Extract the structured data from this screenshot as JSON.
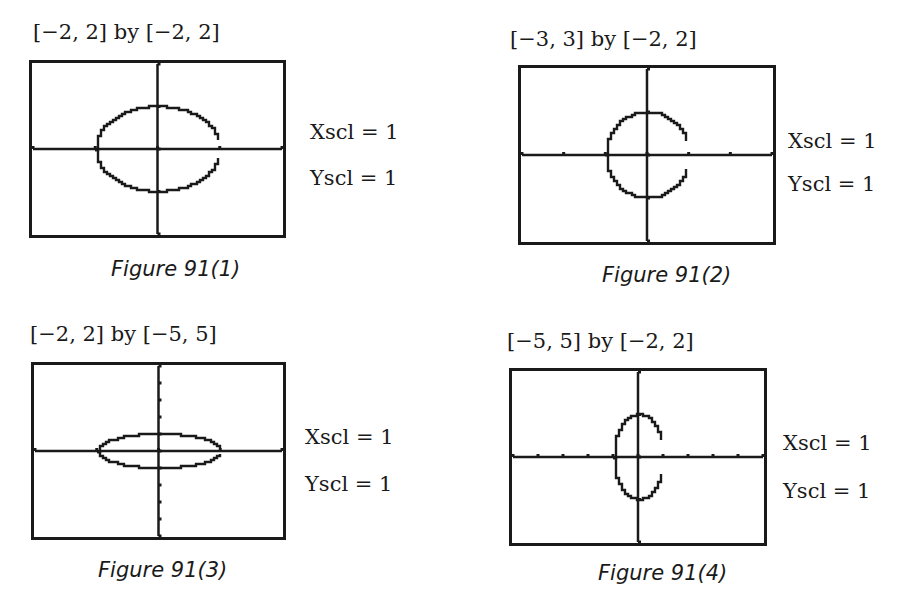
{
  "page": {
    "figures": [
      {
        "window_label": "[−2, 2] by [−2, 2]",
        "xscl_label": "Xscl = 1",
        "yscl_label": "Yscl = 1",
        "caption": "Figure 91(1)"
      },
      {
        "window_label": "[−3, 3] by [−2, 2]",
        "xscl_label": "Xscl = 1",
        "yscl_label": "Yscl = 1",
        "caption": "Figure 91(2)"
      },
      {
        "window_label": "[−2, 2] by [−5, 5]",
        "xscl_label": "Xscl = 1",
        "yscl_label": "Yscl = 1",
        "caption": "Figure 91(3)"
      },
      {
        "window_label": "[−5, 5] by [−2, 2]",
        "xscl_label": "Xscl = 1",
        "yscl_label": "Yscl = 1",
        "caption": "Figure 91(4)"
      }
    ]
  },
  "chart_data": [
    {
      "type": "line",
      "title": "Figure 91(1)",
      "window": "[-2, 2] by [-2, 2]",
      "xlim": [
        -2,
        2
      ],
      "ylim": [
        -2,
        2
      ],
      "xscl": 1,
      "yscl": 1,
      "grid": false,
      "curve": "ellipse",
      "x_intercepts": [
        -1,
        1
      ],
      "y_intercepts": [
        -1,
        1
      ],
      "semi_axis_x": 1,
      "semi_axis_y": 1,
      "note": "circle of radius 1 appears as a wide ellipse due to non-square window"
    },
    {
      "type": "line",
      "title": "Figure 91(2)",
      "window": "[-3, 3] by [-2, 2]",
      "xlim": [
        -3,
        3
      ],
      "ylim": [
        -2,
        2
      ],
      "xscl": 1,
      "yscl": 1,
      "grid": false,
      "curve": "circle",
      "x_intercepts": [
        -1,
        1
      ],
      "y_intercepts": [
        -1,
        1
      ],
      "semi_axis_x": 1,
      "semi_axis_y": 1,
      "note": "square viewing window; circle appears round"
    },
    {
      "type": "line",
      "title": "Figure 91(3)",
      "window": "[-2, 2] by [-5, 5]",
      "xlim": [
        -2,
        2
      ],
      "ylim": [
        -5,
        5
      ],
      "xscl": 1,
      "yscl": 1,
      "grid": false,
      "curve": "ellipse",
      "x_intercepts": [
        -1,
        1
      ],
      "y_intercepts": [
        -1,
        1
      ],
      "semi_axis_x": 1,
      "semi_axis_y": 1,
      "note": "circle appears as flat, wide ellipse"
    },
    {
      "type": "line",
      "title": "Figure 91(4)",
      "window": "[-5, 5] by [-2, 2]",
      "xlim": [
        -5,
        5
      ],
      "ylim": [
        -2,
        2
      ],
      "xscl": 1,
      "yscl": 1,
      "grid": false,
      "curve": "ellipse",
      "x_intercepts": [
        -1,
        1
      ],
      "y_intercepts": [
        -1,
        1
      ],
      "semi_axis_x": 1,
      "semi_axis_y": 1,
      "note": "circle appears as tall, narrow ellipse"
    }
  ]
}
